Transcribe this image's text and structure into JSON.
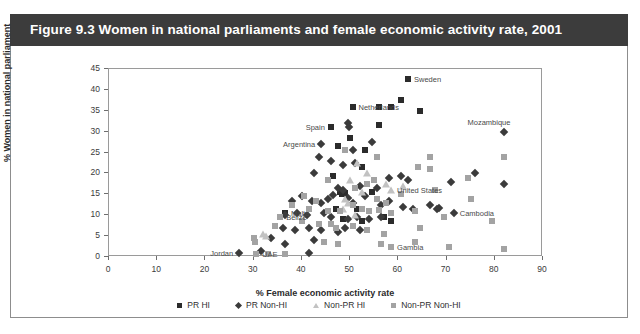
{
  "figure": {
    "title": "Figure 9.3  Women in national parliaments and female economic activity rate, 2001",
    "banner_color": "#3c3c3c",
    "banner_text_color": "#ffffff",
    "frame_color": "#8d8d8d"
  },
  "legend": {
    "items": [
      {
        "label": "PR HI",
        "marker": "square-marker-icon",
        "color": "#2b2b2b"
      },
      {
        "label": "PR Non-HI",
        "marker": "diamond-marker-icon",
        "color": "#3b3b3b"
      },
      {
        "label": "Non-PR HI",
        "marker": "triangle-marker-icon",
        "color": "#c2c2c2"
      },
      {
        "label": "Non-PR Non-HI",
        "marker": "square-marker-icon",
        "color": "#a3a3a3"
      }
    ]
  },
  "chart_data": {
    "type": "scatter",
    "title": "Figure 9.3  Women in national parliaments and female economic activity rate, 2001",
    "xlabel": "% Female economic activity rate",
    "ylabel": "% Women in national parliament",
    "xlim": [
      0,
      90
    ],
    "ylim": [
      0,
      45
    ],
    "xticks": [
      0,
      10,
      20,
      30,
      40,
      50,
      60,
      70,
      80,
      90
    ],
    "yticks": [
      0,
      5,
      10,
      15,
      20,
      25,
      30,
      35,
      40,
      45
    ],
    "grid": false,
    "legend_position": "bottom-center",
    "series": [
      {
        "name": "PR HI",
        "marker": "square",
        "color": "#2b2b2b",
        "points": [
          {
            "x": 62.0,
            "y": 42.5,
            "label": "Sweden"
          },
          {
            "x": 50.5,
            "y": 36.0,
            "label": "Netherlands"
          },
          {
            "x": 56.0,
            "y": 36.0,
            "label": ""
          },
          {
            "x": 58.5,
            "y": 36.0,
            "label": ""
          },
          {
            "x": 60.5,
            "y": 37.5,
            "label": ""
          },
          {
            "x": 64.5,
            "y": 35.0,
            "label": ""
          },
          {
            "x": 46.0,
            "y": 31.0,
            "label": "Spain"
          },
          {
            "x": 56.0,
            "y": 31.5,
            "label": ""
          },
          {
            "x": 50.0,
            "y": 28.5,
            "label": ""
          },
          {
            "x": 47.5,
            "y": 26.5,
            "label": ""
          },
          {
            "x": 53.0,
            "y": 25.5,
            "label": ""
          },
          {
            "x": 52.5,
            "y": 21.5,
            "label": ""
          },
          {
            "x": 46.5,
            "y": 19.5,
            "label": ""
          },
          {
            "x": 48.0,
            "y": 15.5,
            "label": ""
          },
          {
            "x": 48.3,
            "y": 15.0,
            "label": ""
          },
          {
            "x": 49.0,
            "y": 15.2,
            "label": ""
          },
          {
            "x": 54.5,
            "y": 15.5,
            "label": ""
          },
          {
            "x": 47.0,
            "y": 11.5,
            "label": ""
          },
          {
            "x": 51.5,
            "y": 11.5,
            "label": ""
          },
          {
            "x": 36.5,
            "y": 10.5,
            "label": "Malta"
          },
          {
            "x": 48.5,
            "y": 9.0,
            "label": ""
          },
          {
            "x": 52.5,
            "y": 8.5,
            "label": ""
          },
          {
            "x": 57.0,
            "y": 9.5,
            "label": ""
          },
          {
            "x": 58.5,
            "y": 8.5,
            "label": ""
          }
        ]
      },
      {
        "name": "PR Non-HI",
        "marker": "diamond",
        "color": "#3b3b3b",
        "points": [
          {
            "x": 82.0,
            "y": 30.0,
            "label": "Mozambique"
          },
          {
            "x": 44.0,
            "y": 27.0,
            "label": "Argentina"
          },
          {
            "x": 49.5,
            "y": 32.0,
            "label": ""
          },
          {
            "x": 49.8,
            "y": 31.2,
            "label": ""
          },
          {
            "x": 54.5,
            "y": 27.5,
            "label": ""
          },
          {
            "x": 43.5,
            "y": 24.0,
            "label": ""
          },
          {
            "x": 46.0,
            "y": 23.0,
            "label": ""
          },
          {
            "x": 48.5,
            "y": 22.0,
            "label": ""
          },
          {
            "x": 50.5,
            "y": 25.5,
            "label": ""
          },
          {
            "x": 42.5,
            "y": 20.0,
            "label": ""
          },
          {
            "x": 51.0,
            "y": 22.5,
            "label": ""
          },
          {
            "x": 58.0,
            "y": 19.0,
            "label": ""
          },
          {
            "x": 60.5,
            "y": 19.5,
            "label": ""
          },
          {
            "x": 62.0,
            "y": 18.5,
            "label": ""
          },
          {
            "x": 71.0,
            "y": 18.0,
            "label": ""
          },
          {
            "x": 76.0,
            "y": 20.0,
            "label": ""
          },
          {
            "x": 82.0,
            "y": 17.5,
            "label": ""
          },
          {
            "x": 47.5,
            "y": 16.5,
            "label": ""
          },
          {
            "x": 48.5,
            "y": 16.0,
            "label": ""
          },
          {
            "x": 52.0,
            "y": 17.0,
            "label": ""
          },
          {
            "x": 55.5,
            "y": 16.5,
            "label": ""
          },
          {
            "x": 38.0,
            "y": 13.5,
            "label": ""
          },
          {
            "x": 40.0,
            "y": 14.5,
            "label": ""
          },
          {
            "x": 42.0,
            "y": 13.5,
            "label": ""
          },
          {
            "x": 44.0,
            "y": 13.0,
            "label": ""
          },
          {
            "x": 45.5,
            "y": 14.0,
            "label": ""
          },
          {
            "x": 46.5,
            "y": 14.8,
            "label": ""
          },
          {
            "x": 49.5,
            "y": 14.2,
            "label": ""
          },
          {
            "x": 50.5,
            "y": 13.0,
            "label": ""
          },
          {
            "x": 53.0,
            "y": 14.5,
            "label": ""
          },
          {
            "x": 56.5,
            "y": 12.5,
            "label": ""
          },
          {
            "x": 58.0,
            "y": 13.5,
            "label": ""
          },
          {
            "x": 61.0,
            "y": 12.0,
            "label": ""
          },
          {
            "x": 63.0,
            "y": 11.5,
            "label": ""
          },
          {
            "x": 66.5,
            "y": 12.5,
            "label": ""
          },
          {
            "x": 71.5,
            "y": 10.5,
            "label": "Cambodia"
          },
          {
            "x": 68.0,
            "y": 11.5,
            "label": ""
          },
          {
            "x": 68.5,
            "y": 11.8,
            "label": ""
          },
          {
            "x": 36.5,
            "y": 10.0,
            "label": ""
          },
          {
            "x": 39.0,
            "y": 10.5,
            "label": ""
          },
          {
            "x": 41.0,
            "y": 10.0,
            "label": ""
          },
          {
            "x": 44.5,
            "y": 10.5,
            "label": ""
          },
          {
            "x": 46.0,
            "y": 9.5,
            "label": ""
          },
          {
            "x": 49.5,
            "y": 9.0,
            "label": ""
          },
          {
            "x": 51.5,
            "y": 9.5,
            "label": ""
          },
          {
            "x": 54.0,
            "y": 9.0,
            "label": ""
          },
          {
            "x": 56.5,
            "y": 9.5,
            "label": ""
          },
          {
            "x": 36.0,
            "y": 7.0,
            "label": ""
          },
          {
            "x": 38.5,
            "y": 6.5,
            "label": ""
          },
          {
            "x": 41.5,
            "y": 7.0,
            "label": ""
          },
          {
            "x": 44.0,
            "y": 6.5,
            "label": ""
          },
          {
            "x": 47.5,
            "y": 6.0,
            "label": ""
          },
          {
            "x": 49.0,
            "y": 7.0,
            "label": ""
          },
          {
            "x": 52.0,
            "y": 6.5,
            "label": ""
          },
          {
            "x": 33.5,
            "y": 4.5,
            "label": ""
          },
          {
            "x": 42.5,
            "y": 4.0,
            "label": ""
          },
          {
            "x": 36.5,
            "y": 3.0,
            "label": ""
          },
          {
            "x": 27.0,
            "y": 1.0,
            "label": "Jordan"
          },
          {
            "x": 41.5,
            "y": 1.0,
            "label": ""
          },
          {
            "x": 31.5,
            "y": 1.5,
            "label": ""
          }
        ]
      },
      {
        "name": "Non-PR HI",
        "marker": "triangle",
        "color": "#c2c2c2",
        "points": [
          {
            "x": 51.5,
            "y": 22.5,
            "label": ""
          },
          {
            "x": 53.5,
            "y": 20.0,
            "label": ""
          },
          {
            "x": 50.0,
            "y": 18.5,
            "label": ""
          },
          {
            "x": 57.5,
            "y": 17.5,
            "label": ""
          },
          {
            "x": 61.0,
            "y": 17.0,
            "label": ""
          },
          {
            "x": 58.5,
            "y": 16.0,
            "label": "United States"
          },
          {
            "x": 52.5,
            "y": 15.5,
            "label": ""
          },
          {
            "x": 49.0,
            "y": 14.0,
            "label": ""
          },
          {
            "x": 49.5,
            "y": 13.0,
            "label": ""
          },
          {
            "x": 48.5,
            "y": 11.5,
            "label": ""
          },
          {
            "x": 51.0,
            "y": 10.0,
            "label": ""
          },
          {
            "x": 32.0,
            "y": 5.5,
            "label": ""
          },
          {
            "x": 32.5,
            "y": 5.0,
            "label": ""
          }
        ]
      },
      {
        "name": "Non-PR Non-HI",
        "marker": "square",
        "color": "#a3a3a3",
        "points": [
          {
            "x": 49.0,
            "y": 25.5,
            "label": ""
          },
          {
            "x": 55.5,
            "y": 24.0,
            "label": ""
          },
          {
            "x": 66.5,
            "y": 24.0,
            "label": ""
          },
          {
            "x": 82.0,
            "y": 24.0,
            "label": ""
          },
          {
            "x": 64.0,
            "y": 21.5,
            "label": ""
          },
          {
            "x": 66.5,
            "y": 21.0,
            "label": ""
          },
          {
            "x": 74.5,
            "y": 19.0,
            "label": ""
          },
          {
            "x": 45.5,
            "y": 18.5,
            "label": ""
          },
          {
            "x": 55.0,
            "y": 18.5,
            "label": ""
          },
          {
            "x": 67.5,
            "y": 16.0,
            "label": ""
          },
          {
            "x": 53.5,
            "y": 17.5,
            "label": ""
          },
          {
            "x": 60.5,
            "y": 15.0,
            "label": ""
          },
          {
            "x": 51.0,
            "y": 16.5,
            "label": ""
          },
          {
            "x": 40.5,
            "y": 14.5,
            "label": ""
          },
          {
            "x": 43.0,
            "y": 13.5,
            "label": ""
          },
          {
            "x": 50.5,
            "y": 12.5,
            "label": ""
          },
          {
            "x": 55.5,
            "y": 14.0,
            "label": ""
          },
          {
            "x": 57.5,
            "y": 13.0,
            "label": ""
          },
          {
            "x": 35.5,
            "y": 9.5,
            "label": "Belize"
          },
          {
            "x": 38.0,
            "y": 12.5,
            "label": ""
          },
          {
            "x": 41.5,
            "y": 11.5,
            "label": ""
          },
          {
            "x": 45.5,
            "y": 11.0,
            "label": ""
          },
          {
            "x": 48.0,
            "y": 11.0,
            "label": ""
          },
          {
            "x": 52.5,
            "y": 11.5,
            "label": ""
          },
          {
            "x": 54.0,
            "y": 11.0,
            "label": ""
          },
          {
            "x": 56.0,
            "y": 11.2,
            "label": ""
          },
          {
            "x": 58.5,
            "y": 10.5,
            "label": ""
          },
          {
            "x": 63.5,
            "y": 11.0,
            "label": ""
          },
          {
            "x": 34.5,
            "y": 7.5,
            "label": ""
          },
          {
            "x": 40.0,
            "y": 8.5,
            "label": ""
          },
          {
            "x": 43.5,
            "y": 8.0,
            "label": ""
          },
          {
            "x": 46.0,
            "y": 8.0,
            "label": ""
          },
          {
            "x": 47.0,
            "y": 7.0,
            "label": ""
          },
          {
            "x": 50.5,
            "y": 7.5,
            "label": ""
          },
          {
            "x": 53.5,
            "y": 6.5,
            "label": ""
          },
          {
            "x": 57.0,
            "y": 5.5,
            "label": ""
          },
          {
            "x": 64.5,
            "y": 7.0,
            "label": ""
          },
          {
            "x": 69.5,
            "y": 9.5,
            "label": ""
          },
          {
            "x": 75.0,
            "y": 14.0,
            "label": ""
          },
          {
            "x": 79.5,
            "y": 8.5,
            "label": ""
          },
          {
            "x": 30.0,
            "y": 4.5,
            "label": ""
          },
          {
            "x": 30.2,
            "y": 3.5,
            "label": ""
          },
          {
            "x": 44.5,
            "y": 3.5,
            "label": ""
          },
          {
            "x": 47.5,
            "y": 3.0,
            "label": ""
          },
          {
            "x": 56.5,
            "y": 3.0,
            "label": ""
          },
          {
            "x": 58.5,
            "y": 2.5,
            "label": "Gambia"
          },
          {
            "x": 63.5,
            "y": 3.5,
            "label": ""
          },
          {
            "x": 70.5,
            "y": 2.5,
            "label": ""
          },
          {
            "x": 82.0,
            "y": 2.0,
            "label": ""
          },
          {
            "x": 30.5,
            "y": 0.8,
            "label": "UAE"
          },
          {
            "x": 33.0,
            "y": 0.6,
            "label": ""
          },
          {
            "x": 36.5,
            "y": 0.6,
            "label": ""
          }
        ]
      }
    ],
    "annotations": [
      {
        "text": "Sweden",
        "anchor": "left",
        "x": 62.0,
        "y": 42.5
      },
      {
        "text": "Netherlands",
        "anchor": "left",
        "x": 50.5,
        "y": 36.0
      },
      {
        "text": "Mozambique",
        "anchor": "above",
        "x": 82.0,
        "y": 30.0
      },
      {
        "text": "Spain",
        "anchor": "right",
        "x": 46.0,
        "y": 31.0
      },
      {
        "text": "Argentina",
        "anchor": "right",
        "x": 44.0,
        "y": 27.0
      },
      {
        "text": "United States",
        "anchor": "left",
        "x": 58.5,
        "y": 16.0
      },
      {
        "text": "Cambodia",
        "anchor": "left",
        "x": 71.5,
        "y": 10.5
      },
      {
        "text": "Malta",
        "anchor": "left",
        "x": 36.5,
        "y": 10.5
      },
      {
        "text": "Belize",
        "anchor": "left",
        "x": 35.5,
        "y": 9.5
      },
      {
        "text": "Jordan",
        "anchor": "right",
        "x": 27.0,
        "y": 1.0
      },
      {
        "text": "UAE",
        "anchor": "left",
        "x": 30.5,
        "y": 0.8
      },
      {
        "text": "Gambia",
        "anchor": "left",
        "x": 58.5,
        "y": 2.5
      }
    ]
  }
}
